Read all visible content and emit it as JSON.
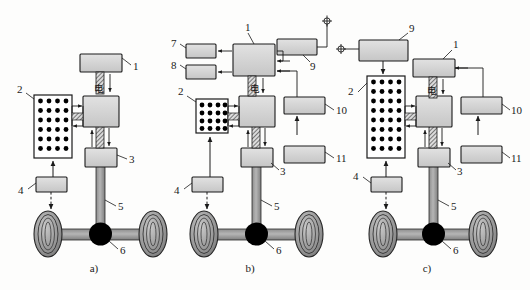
{
  "figure": {
    "background_color": "#fdfdfc",
    "box_fill": "#d4d4d4",
    "box_stroke": "#1a1a1a",
    "shaft_fill": "#9a9a9a",
    "hub_fill": "#000000",
    "battery_fill": "#ffffff",
    "battery_cell_color": "#000000"
  },
  "captions": [
    {
      "id": "caption-a",
      "text": "a)"
    },
    {
      "id": "caption-b",
      "text": "b)"
    },
    {
      "id": "caption-c",
      "text": "c)"
    }
  ],
  "chinese_label": "电",
  "panels": [
    {
      "key": "a",
      "caption": "a)",
      "callouts": [
        {
          "id": "a-1",
          "text": "1"
        },
        {
          "id": "a-2",
          "text": "2"
        },
        {
          "id": "a-3",
          "text": "3"
        },
        {
          "id": "a-4",
          "text": "4"
        },
        {
          "id": "a-5",
          "text": "5"
        },
        {
          "id": "a-6",
          "text": "6"
        }
      ],
      "cn_label": "电"
    },
    {
      "key": "b",
      "caption": "b)",
      "callouts": [
        {
          "id": "b-1",
          "text": "1"
        },
        {
          "id": "b-2",
          "text": "2"
        },
        {
          "id": "b-3",
          "text": "3"
        },
        {
          "id": "b-4",
          "text": "4"
        },
        {
          "id": "b-5",
          "text": "5"
        },
        {
          "id": "b-6",
          "text": "6"
        },
        {
          "id": "b-7",
          "text": "7"
        },
        {
          "id": "b-8",
          "text": "8"
        },
        {
          "id": "b-9",
          "text": "9"
        },
        {
          "id": "b-10",
          "text": "10"
        },
        {
          "id": "b-11",
          "text": "11"
        }
      ],
      "cn_label": "电"
    },
    {
      "key": "c",
      "caption": "c)",
      "callouts": [
        {
          "id": "c-1",
          "text": "1"
        },
        {
          "id": "c-2",
          "text": "2"
        },
        {
          "id": "c-3",
          "text": "3"
        },
        {
          "id": "c-4",
          "text": "4"
        },
        {
          "id": "c-5",
          "text": "5"
        },
        {
          "id": "c-6",
          "text": "6"
        },
        {
          "id": "c-9",
          "text": "9"
        },
        {
          "id": "c-10",
          "text": "10"
        },
        {
          "id": "c-11",
          "text": "11"
        }
      ],
      "cn_label": "电"
    }
  ]
}
